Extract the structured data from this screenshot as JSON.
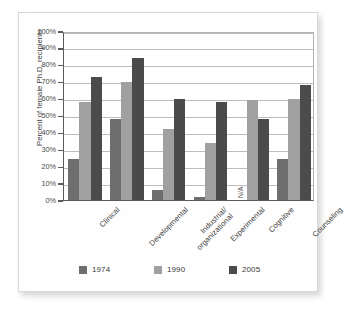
{
  "chart_data": {
    "type": "bar",
    "title": "",
    "subtitle": "",
    "xlabel": "",
    "ylabel": "Percent of female Ph.D. recipients",
    "ylim": [
      0,
      100
    ],
    "grid": true,
    "legend_position": "bottom",
    "categories": [
      "Clinical",
      "Developmental",
      "Industrial/\norganizational",
      "Experimental",
      "Cognitive",
      "Counseling"
    ],
    "category_lines": [
      [
        "Clinical"
      ],
      [
        "Developmental"
      ],
      [
        "Industrial/",
        "organizational"
      ],
      [
        "Experimental"
      ],
      [
        "Cognitive"
      ],
      [
        "Counseling"
      ]
    ],
    "series": [
      {
        "name": "1974",
        "color": "#6e6e6e",
        "values": [
          24,
          48,
          6,
          2,
          null,
          24
        ]
      },
      {
        "name": "1990",
        "color": "#a0a0a0",
        "values": [
          58,
          70,
          42,
          34,
          59,
          60
        ]
      },
      {
        "name": "2005",
        "color": "#4b4b4b",
        "values": [
          73,
          84,
          60,
          58,
          48,
          68
        ]
      }
    ],
    "missing_label": "N/A",
    "missing_at": {
      "series": "1974",
      "category": "Cognitive"
    },
    "ytick_labels": [
      "0%",
      "10%",
      "20%",
      "30%",
      "40%",
      "50%",
      "60%",
      "70%",
      "80%",
      "90%",
      "100%"
    ],
    "ytick_values": [
      0,
      10,
      20,
      30,
      40,
      50,
      60,
      70,
      80,
      90,
      100
    ]
  },
  "legend": {
    "items": [
      {
        "label": "1974",
        "color": "#6e6e6e"
      },
      {
        "label": "1990",
        "color": "#a0a0a0"
      },
      {
        "label": "2005",
        "color": "#4b4b4b"
      }
    ]
  }
}
